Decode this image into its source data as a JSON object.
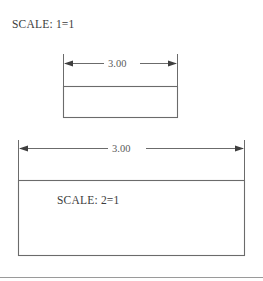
{
  "drawing": {
    "background_color": "#ffffff",
    "line_color": "#5e5e5e",
    "text_color": "#3c3c3c",
    "labels": {
      "scale_top": "SCALE: 1=1",
      "scale_inner": "SCALE: 2=1"
    },
    "dimensions": {
      "top_value": "3.00",
      "bottom_value": "3.00"
    },
    "shapes": {
      "small_rectangle": {
        "name": "small-rectangle",
        "x": 63,
        "y": 86,
        "width": 115,
        "height": 32
      },
      "large_rectangle": {
        "name": "large-rectangle",
        "x": 18,
        "y": 180,
        "width": 227,
        "height": 76
      }
    },
    "dimension_lines": {
      "top": {
        "y": 63,
        "x1": 63,
        "x2": 178,
        "gap_start": 104,
        "gap_end": 139
      },
      "bottom": {
        "y": 148,
        "x1": 18,
        "x2": 245,
        "gap_start": 108,
        "gap_end": 146
      }
    },
    "footer_rule": {
      "y": 277,
      "x1": 0,
      "x2": 263
    }
  }
}
